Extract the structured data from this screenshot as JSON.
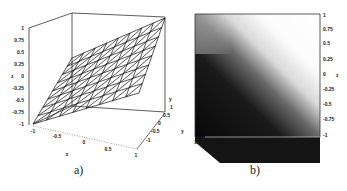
{
  "figure_a": {
    "caption": "a)",
    "type": "3d-wireframe-surface",
    "z_axis": {
      "label": "z",
      "ticks": [
        "1",
        "0.75",
        "0.5",
        "0.25",
        "0",
        "-0.25",
        "-0.5",
        "-0.75",
        "-1"
      ]
    },
    "x_axis": {
      "label": "x",
      "ticks": [
        "-1",
        "-0.5",
        "0",
        "0.5",
        "1"
      ]
    },
    "y_axis": {
      "label": "y",
      "ticks": [
        "-1",
        "-0.5",
        "0",
        "0.5",
        "1"
      ]
    }
  },
  "figure_b": {
    "caption": "b)",
    "type": "3d-shaded-surface-top-view",
    "z_axis": {
      "label": "z",
      "ticks": [
        "1",
        "0.75",
        "0.5",
        "0.25",
        "0",
        "-0.25",
        "-0.5",
        "-0.75",
        "-1"
      ]
    },
    "y_axis": {
      "label": "y"
    },
    "corner_tick": "1"
  },
  "chart_data": [
    {
      "type": "surface",
      "title": "a)",
      "xlabel": "x",
      "ylabel": "y",
      "zlabel": "z",
      "xlim": [
        -1,
        1
      ],
      "ylim": [
        -1,
        1
      ],
      "zlim": [
        -1,
        1
      ],
      "description": "planar wireframe surface rising from z=-1 at (x=-1,y=-1) to z=1 at (x=1,y=1), triangulated mesh",
      "x_ticks": [
        -1,
        -0.5,
        0,
        0.5,
        1
      ],
      "y_ticks": [
        -1,
        -0.5,
        0,
        0.5,
        1
      ],
      "z_ticks": [
        -1,
        -0.75,
        -0.5,
        -0.25,
        0,
        0.25,
        0.5,
        0.75,
        1
      ],
      "grid": false
    },
    {
      "type": "heatmap",
      "title": "b)",
      "ylabel": "y",
      "zlabel": "z",
      "zlim": [
        -1,
        1
      ],
      "description": "shaded surface, gray-scale gradient from dark (low z, bottom-left) to white (high z, top-right) along diagonal",
      "z_ticks": [
        1,
        0.75,
        0.5,
        0.25,
        0,
        -0.25,
        -0.5,
        -0.75,
        -1
      ],
      "grid": false
    }
  ]
}
